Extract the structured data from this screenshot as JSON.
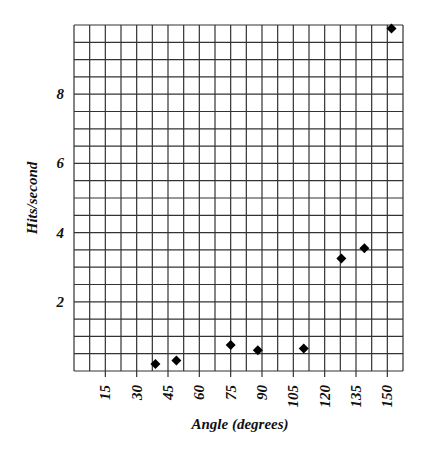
{
  "chart_data": {
    "type": "scatter",
    "title": "",
    "xlabel": "Angle (degrees)",
    "ylabel": "Hits/second",
    "xlim": [
      0,
      157.5
    ],
    "ylim": [
      0,
      10
    ],
    "x_ticks": [
      15,
      30,
      45,
      60,
      75,
      90,
      105,
      120,
      135,
      150
    ],
    "y_ticks": [
      2,
      4,
      6,
      8
    ],
    "x_minor_step": 7.5,
    "y_minor_step": 0.5,
    "grid": true,
    "legend": null,
    "marker": "diamond",
    "series": [
      {
        "name": "Hits/second",
        "x": [
          39,
          49,
          75,
          88,
          110,
          128,
          139,
          152
        ],
        "y": [
          0.2,
          0.3,
          0.75,
          0.6,
          0.65,
          3.25,
          3.55,
          9.9
        ]
      }
    ]
  },
  "colors": {
    "grid": "#333333",
    "marker": "#000000",
    "text": "#111111",
    "background": "#ffffff"
  }
}
